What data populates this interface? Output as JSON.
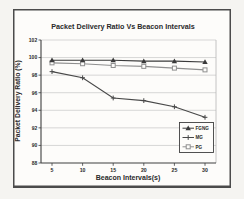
{
  "chart_data": {
    "type": "line",
    "title": "Packet Delivery Ratio Vs Beacon Intervals",
    "xlabel": "Beacon Intervals(s)",
    "ylabel": "Packet Delivery Ratio (%)",
    "x": [
      5,
      10,
      15,
      20,
      25,
      30
    ],
    "xticklabels": [
      "5",
      "10",
      "15",
      "20",
      "25",
      "30"
    ],
    "ylim": [
      88,
      102
    ],
    "ytick_step": 2,
    "grid": true,
    "legend_position": "inside-bottom-right",
    "series": [
      {
        "name": "FGNG",
        "marker": "triangle",
        "color": "#3a3a3a",
        "values": [
          99.7,
          99.7,
          99.7,
          99.6,
          99.6,
          99.5
        ]
      },
      {
        "name": "MG",
        "marker": "plus",
        "color": "#484848",
        "values": [
          98.4,
          97.7,
          95.4,
          95.1,
          94.4,
          93.2
        ]
      },
      {
        "name": "PG",
        "marker": "square",
        "color": "#8f8f8f",
        "values": [
          99.4,
          99.3,
          99.1,
          99.0,
          98.8,
          98.6
        ]
      }
    ]
  },
  "appearance": {
    "page_background": "#f5f4f1",
    "plot_background": "#fdfcfa",
    "frame_color": "#4b4b4b",
    "axis_color": "#3e3e3e",
    "grid_color": "#c6c6c6",
    "right_border_color": "#b5b5b5",
    "text_color": "#2a2a2a",
    "legend_border_color": "#3f3f3f"
  }
}
